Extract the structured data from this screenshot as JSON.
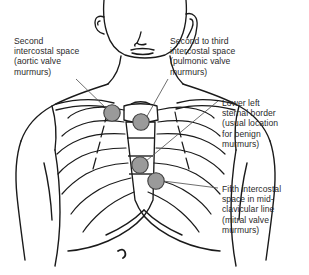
{
  "figure": {
    "view": "anterior"
  },
  "colors": {
    "marker_fill": "#9a9a9a",
    "marker_stroke": "#3d3d3d",
    "line_art": "#1a1a1a",
    "rib_shading": "#6e6e6e",
    "text": "#2a2a2a",
    "leader_line": "#555555",
    "background": "#ffffff"
  },
  "labels": {
    "aortic": "Second\nintercostal space\n(aortic valve\nmurmurs)",
    "pulmonic": "Second to third\nintercostal space\n(pulmonic valve\nmurmurs)",
    "sternal": "Lower left\nsternal border\n(usual location\nfor benign\nmurmurs)",
    "mitral": "Fifth intercostal\nspace in mid-\nclavicular line\n(mitral valve\nmurmurs)"
  },
  "markers": [
    {
      "name": "aortic-area-marker",
      "x": 112,
      "y": 113,
      "r": 8.2,
      "label": "aortic"
    },
    {
      "name": "pulmonic-area-marker",
      "x": 141,
      "y": 122,
      "r": 8.2,
      "label": "pulmonic"
    },
    {
      "name": "tricuspid-area-marker",
      "x": 140,
      "y": 165,
      "r": 8.2,
      "label": "sternal"
    },
    {
      "name": "mitral-area-marker",
      "x": 156,
      "y": 181,
      "r": 8.2,
      "label": "mitral"
    }
  ],
  "leader_lines": [
    {
      "name": "leader-aortic",
      "x1": 76,
      "y1": 79,
      "x2": 108,
      "y2": 110
    },
    {
      "name": "leader-pulmonic",
      "x1": 168,
      "y1": 79,
      "x2": 146,
      "y2": 118
    },
    {
      "name": "leader-sternal",
      "x1": 218,
      "y1": 101,
      "x2": 146,
      "y2": 161
    },
    {
      "name": "leader-mitral",
      "x1": 218,
      "y1": 188,
      "x2": 163,
      "y2": 181
    }
  ],
  "caption": ""
}
